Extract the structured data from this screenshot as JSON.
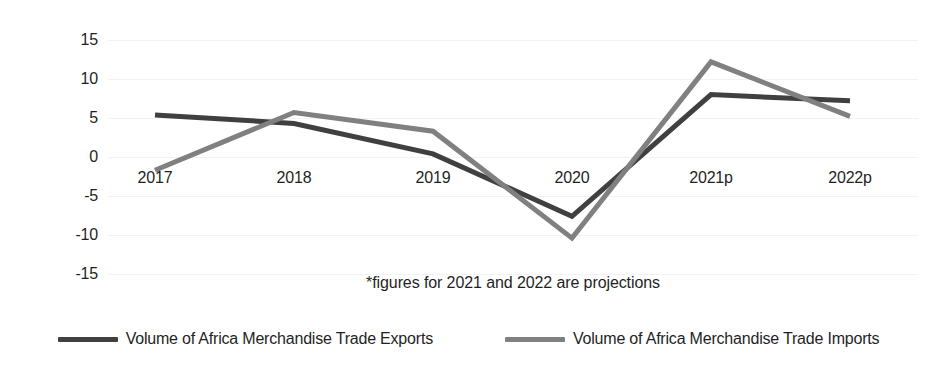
{
  "chart_data": {
    "type": "line",
    "title": "",
    "xlabel": "",
    "ylabel": "Annual % Change",
    "categories": [
      "2017",
      "2018",
      "2019",
      "2020",
      "2021p",
      "2022p"
    ],
    "yticks": [
      "15",
      "10",
      "5",
      "0",
      "-5",
      "-10",
      "-15"
    ],
    "ylim": [
      -15,
      15
    ],
    "grid": true,
    "legend_position": "bottom",
    "annotations": [
      "*figures for 2021 and 2022 are projections"
    ],
    "series": [
      {
        "name": "Volume of Africa Merchandise Trade Exports",
        "color": "#404040",
        "values": [
          5.4,
          4.3,
          0.4,
          -7.6,
          8.0,
          7.2
        ]
      },
      {
        "name": "Volume of Africa Merchandise Trade Imports",
        "color": "#808080",
        "values": [
          -1.7,
          5.7,
          3.3,
          -10.4,
          12.2,
          5.2
        ]
      }
    ]
  },
  "footnote": "*figures for 2021 and 2022 are projections",
  "axis": {
    "y_title": "Annual % Change"
  }
}
